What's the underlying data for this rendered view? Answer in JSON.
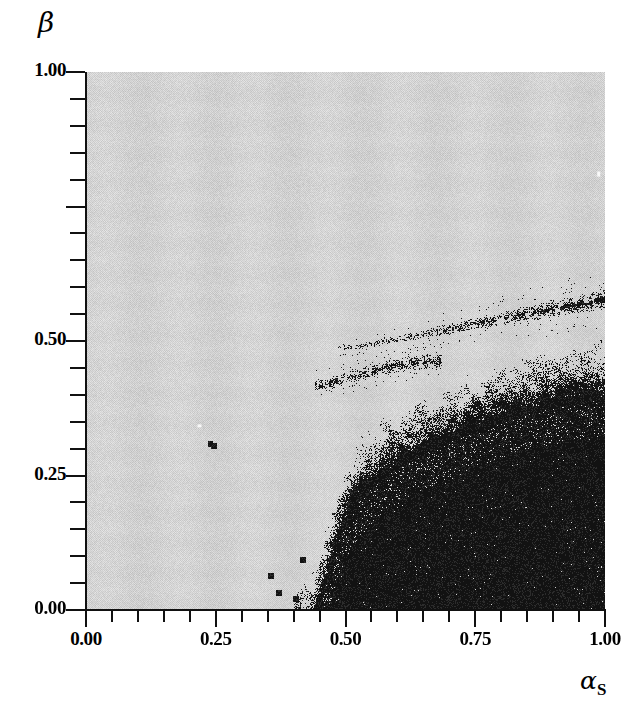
{
  "chart_data": {
    "type": "heatmap",
    "title": "",
    "subtitle": "",
    "xlabel": "alpha_S",
    "ylabel": "beta",
    "xlim": [
      0.0,
      1.0
    ],
    "ylim": [
      0.0,
      1.0
    ],
    "grid": false,
    "legend": "none",
    "x_ticks_labeled": [
      0.0,
      0.25,
      0.5,
      0.75,
      1.0
    ],
    "x_tick_labels": [
      "0.00",
      "0.25",
      "0.50",
      "0.75",
      "1.00"
    ],
    "y_ticks_labeled": [
      0.0,
      0.25,
      0.5,
      1.0
    ],
    "y_tick_labels": [
      "0.00",
      "0.25",
      "0.50",
      "1.00"
    ],
    "minor_tick_step": 0.05,
    "phase_colors": {
      "gray_phase": "#d2d2d2",
      "black_phase": "#101010",
      "background": "#ffffff",
      "axis": "#111111"
    },
    "boundary_main": {
      "name": "main phase boundary",
      "comment": "Noisy arc separating gray phase (upper-left) from black phase (lower-right)",
      "points": [
        [
          0.43,
          0.0
        ],
        [
          0.445,
          0.04
        ],
        [
          0.455,
          0.08
        ],
        [
          0.468,
          0.12
        ],
        [
          0.478,
          0.16
        ],
        [
          0.492,
          0.2
        ],
        [
          0.508,
          0.235
        ],
        [
          0.53,
          0.265
        ],
        [
          0.558,
          0.292
        ],
        [
          0.59,
          0.315
        ],
        [
          0.628,
          0.337
        ],
        [
          0.668,
          0.357
        ],
        [
          0.71,
          0.375
        ],
        [
          0.755,
          0.392
        ],
        [
          0.8,
          0.407
        ],
        [
          0.848,
          0.422
        ],
        [
          0.898,
          0.434
        ],
        [
          0.95,
          0.444
        ],
        [
          1.0,
          0.452
        ]
      ]
    },
    "filament_upper": {
      "name": "upper filament arm",
      "comment": "Thin dense black streak rising to the right near beta = 0.50-0.58",
      "points": [
        [
          0.52,
          0.488
        ],
        [
          0.56,
          0.496
        ],
        [
          0.6,
          0.503
        ],
        [
          0.645,
          0.511
        ],
        [
          0.69,
          0.52
        ],
        [
          0.735,
          0.529
        ],
        [
          0.78,
          0.537
        ],
        [
          0.825,
          0.546
        ],
        [
          0.87,
          0.554
        ],
        [
          0.915,
          0.562
        ],
        [
          0.96,
          0.57
        ],
        [
          1.0,
          0.578
        ]
      ]
    },
    "filament_lower": {
      "name": "lower filament arm",
      "comment": "Shorter black streak near beta = 0.42-0.46 between alpha_S 0.46 and 0.66",
      "points": [
        [
          0.462,
          0.418
        ],
        [
          0.49,
          0.427
        ],
        [
          0.52,
          0.436
        ],
        [
          0.552,
          0.444
        ],
        [
          0.585,
          0.452
        ],
        [
          0.62,
          0.458
        ],
        [
          0.655,
          0.462
        ]
      ]
    },
    "stray_points": [
      [
        0.372,
        0.031
      ],
      [
        0.404,
        0.021
      ],
      [
        0.356,
        0.063
      ],
      [
        0.418,
        0.093
      ],
      [
        0.24,
        0.308
      ],
      [
        0.246,
        0.305
      ]
    ]
  },
  "axes": {
    "y_title": "β",
    "x_title_base": "α",
    "x_title_sub": "S",
    "y_tick_labels": [
      "1.00",
      "0.50",
      "0.25",
      "0.00"
    ],
    "x_tick_labels": [
      "0.00",
      "0.25",
      "0.50",
      "0.75",
      "1.00"
    ]
  },
  "icons": {
    "y_axis": "vertical-axis-line",
    "x_axis": "horizontal-axis-line"
  }
}
